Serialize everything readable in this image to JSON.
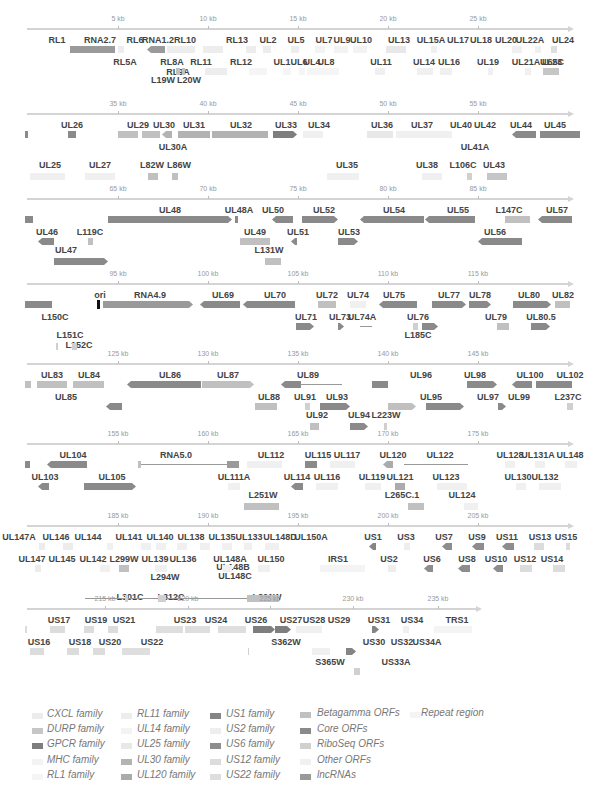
{
  "colors": {
    "core": "#8a8a8a",
    "lncrna": "#9a9a9a",
    "betagamma": "#c0c0c0",
    "riboseq": "#d0d0d0",
    "other": "#f0f0f0",
    "cxcl": "#ececec",
    "durp": "#c6c6c6",
    "gpcr": "#7e7e7e",
    "mhc": "#f3f3f3",
    "rl1": "#f5f5f5",
    "rl11": "#ededed",
    "ul14": "#f3f3f3",
    "ul25": "#e8e8e8",
    "ul30": "#b3b3b3",
    "ul120": "#ababab",
    "us1": "#858585",
    "us2": "#eeeeee",
    "us6": "#8d8d8d",
    "us12": "#dcdcdc",
    "us22": "#dedede",
    "repeat": "#f4f4f4"
  },
  "tracks": [
    {
      "ticks": [
        "5 kb",
        "10 kb",
        "15 kb",
        "20 kb",
        "25 kb"
      ],
      "labels_row1": [
        "RL1",
        "RNA2.7",
        "RL6",
        "RNA1.2",
        "RL10",
        "RL13",
        "UL2",
        "UL5",
        "UL7",
        "UL9",
        "UL10",
        "UL13",
        "UL15A",
        "UL17",
        "UL18",
        "UL20",
        "UL22A",
        "UL24"
      ],
      "labels_row2": [
        "RL5A",
        "RL8A",
        "RL11",
        "RL9A",
        "RL12",
        "UL1",
        "UL4",
        "UL6",
        "UL8",
        "UL11",
        "UL14",
        "UL16",
        "UL19",
        "UL21A",
        "UL23",
        "L65C"
      ],
      "labels_row3": [
        "L19W",
        "L20W"
      ]
    },
    {
      "ticks": [
        "35 kb",
        "40 kb",
        "45 kb",
        "50 kb",
        "55 kb"
      ],
      "labels_row1": [
        "UL26",
        "UL29",
        "UL30",
        "UL31",
        "UL32",
        "UL33",
        "UL34",
        "UL36",
        "UL37",
        "UL40",
        "UL42",
        "UL44",
        "UL45"
      ],
      "labels_row2": [
        "UL30A",
        "UL41A"
      ],
      "labels_row3": [
        "UL25",
        "UL27",
        "L82W",
        "L86W",
        "UL35",
        "UL38",
        "L106C",
        "UL43"
      ]
    },
    {
      "ticks": [
        "65 kb",
        "70 kb",
        "75 kb",
        "80 kb",
        "85 kb"
      ],
      "labels_row1": [
        "UL48",
        "UL48A",
        "UL50",
        "UL52",
        "UL54",
        "UL55",
        "L147C",
        "UL57"
      ],
      "labels_row2": [
        "UL46",
        "L119C",
        "UL49",
        "UL51",
        "UL53",
        "UL56"
      ],
      "labels_row3": [
        "UL47",
        "L131W"
      ]
    },
    {
      "ticks": [
        "95 kb",
        "100 kb",
        "105 kb",
        "110 kb",
        "115 kb"
      ],
      "labels_row1": [
        "ori",
        "RNA4.9",
        "UL69",
        "UL70",
        "UL72",
        "UL74",
        "UL75",
        "UL77",
        "UL78",
        "UL80",
        "UL82"
      ],
      "labels_row2": [
        "L150C",
        "UL71",
        "UL73",
        "UL74A",
        "UL76",
        "UL79",
        "UL80.5"
      ],
      "labels_row3": [
        "L151C",
        "L152C",
        "L185C"
      ]
    },
    {
      "ticks": [
        "125 kb",
        "130 kb",
        "135 kb",
        "140 kb",
        "145 kb"
      ],
      "labels_row1": [
        "UL83",
        "UL84",
        "UL86",
        "UL87",
        "UL89",
        "UL96",
        "UL98",
        "UL100",
        "UL102"
      ],
      "labels_row2": [
        "UL85",
        "UL88",
        "UL91",
        "UL93",
        "UL95",
        "UL97",
        "UL99",
        "L237C"
      ],
      "labels_row3": [
        "UL92",
        "UL94",
        "L223W"
      ]
    },
    {
      "ticks": [
        "155 kb",
        "160 kb",
        "165 kb",
        "170 kb",
        "175 kb"
      ],
      "labels_row1": [
        "UL104",
        "RNA5.0",
        "UL112",
        "UL115",
        "UL117",
        "UL120",
        "UL122",
        "UL128",
        "UL131A",
        "UL148"
      ],
      "labels_row2": [
        "UL103",
        "UL105",
        "UL111A",
        "UL114",
        "UL116",
        "UL119",
        "UL121",
        "UL123",
        "UL130",
        "UL132"
      ],
      "labels_row3": [
        "L251W",
        "L265C.1",
        "UL124"
      ]
    },
    {
      "ticks": [
        "185 kb",
        "190 kb",
        "195 kb",
        "200 kb",
        "205 kb"
      ],
      "labels_row1": [
        "UL147A",
        "UL146",
        "UL144",
        "UL141",
        "UL140",
        "UL138",
        "UL135",
        "UL133",
        "UL148D",
        "UL150A",
        "US1",
        "US3",
        "US7",
        "US9",
        "US11",
        "US13",
        "US15"
      ],
      "labels_row2": [
        "UL147",
        "UL145",
        "UL142",
        "L299W",
        "UL139",
        "UL136",
        "UL148A",
        "UL148B",
        "UL148C",
        "UL150",
        "IRS1",
        "US2",
        "US6",
        "US8",
        "US10",
        "US12",
        "US14"
      ],
      "labels_row3": [
        "L294W",
        "L301C",
        "L312C",
        "L321W"
      ]
    },
    {
      "ticks": [
        "215 kb",
        "220 kb",
        "225 kb",
        "230 kb",
        "235 kb"
      ],
      "labels_row1": [
        "US17",
        "US19",
        "US21",
        "US23",
        "US24",
        "US26",
        "US27",
        "US28",
        "US29",
        "US31",
        "US34",
        "TRS1"
      ],
      "labels_row2": [
        "US16",
        "US18",
        "US20",
        "US22",
        "S362W",
        "US30",
        "US32",
        "US34A"
      ],
      "labels_row3": [
        "S365W",
        "US33A"
      ]
    }
  ],
  "legend": {
    "col1": [
      "CXCL family",
      "DURP family",
      "GPCR family",
      "MHC family",
      "RL1 family"
    ],
    "col2": [
      "RL11 family",
      "UL14 family",
      "UL25 family",
      "UL30 family",
      "UL120 family"
    ],
    "col3": [
      "US1 family",
      "US2 family",
      "US6 family",
      "US12 family",
      "US22 family"
    ],
    "col4": [
      "Betagamma ORFs",
      "Core ORFs",
      "RiboSeq ORFs",
      "Other ORFs",
      "lncRNAs"
    ],
    "col5": [
      "Repeat region"
    ]
  }
}
